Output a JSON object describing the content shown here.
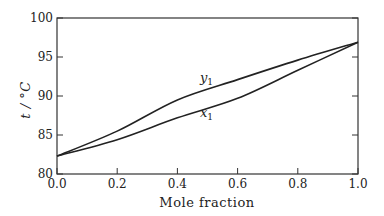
{
  "chart_data": {
    "type": "line",
    "title": "",
    "xlabel": "Mole fraction",
    "ylabel": "t / °C",
    "xlim": [
      0.0,
      1.0
    ],
    "ylim": [
      80,
      100
    ],
    "x_ticks": [
      "0.0",
      "0.2",
      "0.4",
      "0.6",
      "0.8",
      "1.0"
    ],
    "y_ticks": [
      "80",
      "85",
      "90",
      "95",
      "100"
    ],
    "grid": false,
    "legend": "none (inline curve labels)",
    "x": [
      0.0,
      0.2,
      0.4,
      0.6,
      0.8,
      1.0
    ],
    "series": [
      {
        "name": "y1",
        "label_main": "y",
        "label_sub": "1",
        "values": [
          82.3,
          85.5,
          89.5,
          92.1,
          94.6,
          96.9
        ]
      },
      {
        "name": "x1",
        "label_main": "x",
        "label_sub": "1",
        "values": [
          82.3,
          84.4,
          87.2,
          89.7,
          93.3,
          96.9
        ]
      }
    ]
  }
}
